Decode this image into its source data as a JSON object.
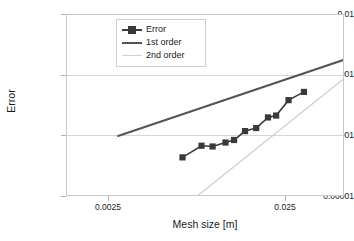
{
  "chart_data": {
    "type": "line",
    "title": "",
    "xlabel": "Mesh size [m]",
    "ylabel": "Error",
    "xscale": "log",
    "yscale": "log",
    "xlim": [
      0.0014,
      0.0345
    ],
    "ylim": [
      1e-05,
      0.01
    ],
    "grid": true,
    "legend_position": "top-center-inside",
    "xticks": [
      "0.0025",
      "0.025"
    ],
    "xtick_values": [
      0.0025,
      0.025
    ],
    "yticks": [
      "0.01",
      "0.001",
      "0.0001",
      "0.00001"
    ],
    "ytick_values": [
      0.01,
      0.001,
      0.0001,
      1e-05
    ],
    "series": [
      {
        "name": "Error",
        "style": "line-markers",
        "color": "#3a3a3a",
        "marker": "square",
        "x": [
          0.0053,
          0.0066,
          0.0075,
          0.0087,
          0.0096,
          0.0109,
          0.0124,
          0.0142,
          0.0156,
          0.018,
          0.0215
        ],
        "y": [
          4.5e-05,
          7e-05,
          6.8e-05,
          7.9e-05,
          8.7e-05,
          0.000122,
          0.000137,
          0.000205,
          0.00022,
          0.000395,
          0.00054
        ]
      },
      {
        "name": "1st order",
        "style": "line",
        "color": "#555555",
        "x": [
          0.0025,
          0.0345
        ],
        "y": [
          0.0001,
          0.00185
        ]
      },
      {
        "name": "2nd order",
        "style": "line",
        "color": "#d2d2d2",
        "x": [
          0.0062,
          0.0345
        ],
        "y": [
          1e-05,
          0.00092
        ]
      }
    ]
  },
  "axes": {
    "y_title": "Error",
    "x_title": "Mesh size [m]",
    "y_ticks": [
      {
        "label": "0.01"
      },
      {
        "label": "0.001"
      },
      {
        "label": "0.0001"
      },
      {
        "label": "0.00001"
      }
    ],
    "x_ticks": [
      {
        "label": "0.0025"
      },
      {
        "label": "0.025"
      }
    ]
  },
  "legend": {
    "items": [
      {
        "label": "Error",
        "color": "#3a3a3a",
        "kind": "marker-line"
      },
      {
        "label": "1st order",
        "color": "#555555",
        "kind": "line"
      },
      {
        "label": "2nd order",
        "color": "#d2d2d2",
        "kind": "line-thin"
      }
    ]
  },
  "colors": {
    "series_error": "#3a3a3a",
    "first_order": "#555555",
    "second_order": "#d2d2d2",
    "grid": "#d6d6d6",
    "frame": "#c9c9c9",
    "background": "#ffffff",
    "text": "#1a1a1a"
  }
}
